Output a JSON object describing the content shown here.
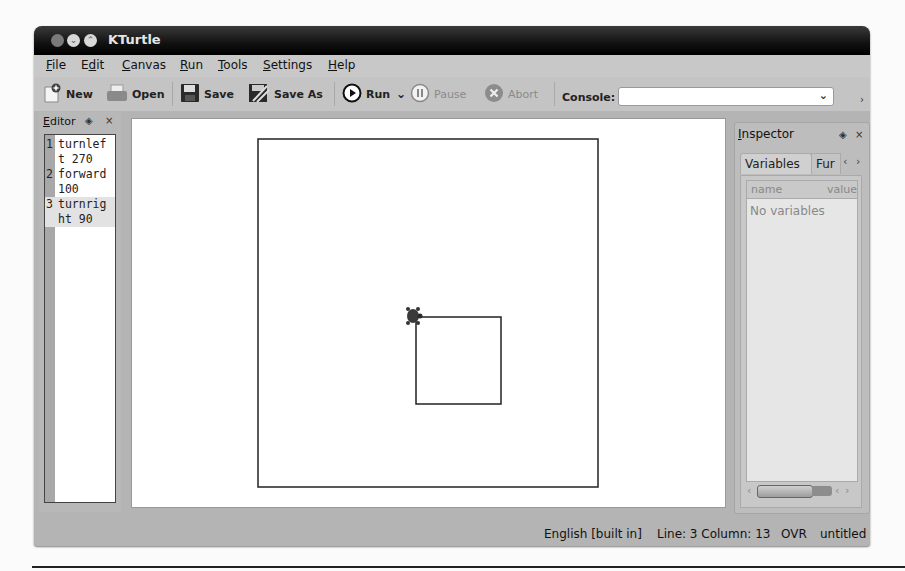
{
  "window": {
    "title": "KTurtle"
  },
  "menubar": {
    "items": [
      {
        "label": "File",
        "mnemonic": "F",
        "rest": "ile"
      },
      {
        "label": "Edit",
        "mnemonic_pre": "E",
        "mnemonic": "d",
        "rest": "it"
      },
      {
        "label": "Canvas",
        "mnemonic": "C",
        "rest": "anvas"
      },
      {
        "label": "Run",
        "mnemonic": "R",
        "rest": "un"
      },
      {
        "label": "Tools",
        "mnemonic": "T",
        "rest": "ools"
      },
      {
        "label": "Settings",
        "mnemonic": "S",
        "rest": "ettings"
      },
      {
        "label": "Help",
        "mnemonic": "H",
        "rest": "elp"
      }
    ]
  },
  "toolbar": {
    "new_label": "New",
    "open_label": "Open",
    "save_label": "Save",
    "save_as_label": "Save As",
    "run_label": "Run",
    "pause_label": "Pause",
    "abort_label": "Abort",
    "console_label": "Console:",
    "console_value": ""
  },
  "editor": {
    "title": "Editor",
    "lines": [
      {
        "num": "1",
        "text": "turnlef",
        "wrap": "t 270"
      },
      {
        "num": "2",
        "text": "forward",
        "wrap": "100"
      },
      {
        "num": "3",
        "text": "turnrig",
        "wrap": "ht 90"
      }
    ]
  },
  "canvas": {
    "outer_rect": {
      "x": 126,
      "y": 20,
      "w": 340,
      "h": 348
    },
    "inner_square": {
      "x": 284,
      "y": 198,
      "w": 85,
      "h": 87
    },
    "turtle": {
      "x": 281,
      "y": 197
    },
    "line_color": "#222222"
  },
  "inspector": {
    "title": "Inspector",
    "tabs": [
      {
        "label": "Variables",
        "active": true
      },
      {
        "label": "Functions",
        "visible": "Fur",
        "active": false
      }
    ],
    "columns": [
      "name",
      "value"
    ],
    "empty_text": "No variables"
  },
  "statusbar": {
    "language": "English [built in]",
    "position": "Line: 3 Column: 13",
    "mode": "OVR",
    "filename": "untitled"
  }
}
